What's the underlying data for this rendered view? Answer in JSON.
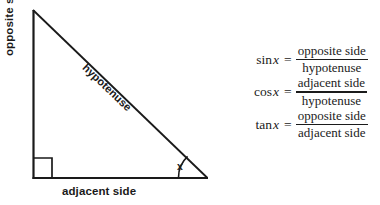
{
  "diagram": {
    "stroke_color": "#1a1a1a",
    "background": "#ffffff",
    "labels": {
      "opposite": "opposite side",
      "adjacent": "adjacent side",
      "hypotenuse": "hypotenuse",
      "angle": "x"
    },
    "vertices": {
      "apex": [
        33,
        10
      ],
      "right_angle": [
        33,
        178
      ],
      "angle_vertex": [
        207,
        178
      ]
    },
    "right_angle_marker": true,
    "angle_arc": true
  },
  "formulas": [
    {
      "name": "sine",
      "function": "sin",
      "variable": "x",
      "equals": "=",
      "numerator": "opposite side",
      "denominator": "hypotenuse"
    },
    {
      "name": "cosine",
      "function": "cos",
      "variable": "x",
      "equals": "=",
      "numerator": "adjacent side",
      "denominator": "hypotenuse"
    },
    {
      "name": "tangent",
      "function": "tan",
      "variable": "x",
      "equals": "=",
      "numerator": "opposite side",
      "denominator": "adjacent side"
    }
  ]
}
